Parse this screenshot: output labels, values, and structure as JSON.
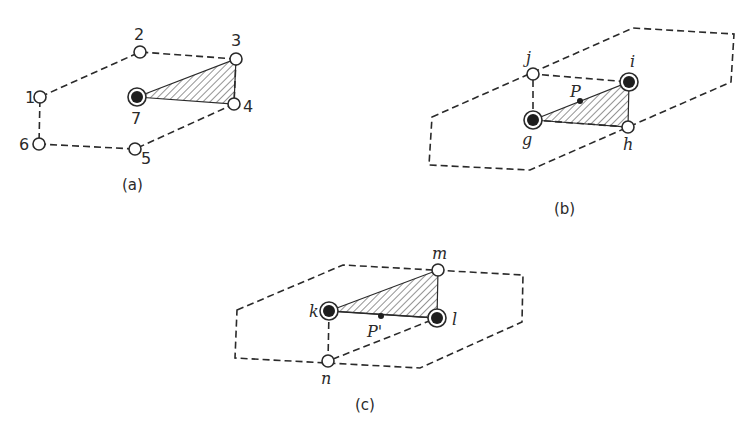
{
  "figure": {
    "panels": [
      {
        "id": "a",
        "caption": "(a)",
        "nodes": [
          {
            "label": "1",
            "type": "open"
          },
          {
            "label": "2",
            "type": "open"
          },
          {
            "label": "3",
            "type": "open"
          },
          {
            "label": "4",
            "type": "open"
          },
          {
            "label": "5",
            "type": "open"
          },
          {
            "label": "6",
            "type": "open"
          },
          {
            "label": "7",
            "type": "filled"
          }
        ],
        "hatched_triangle": [
          "7",
          "3",
          "4"
        ]
      },
      {
        "id": "b",
        "caption": "(b)",
        "nodes": [
          {
            "label": "j",
            "type": "open"
          },
          {
            "label": "i",
            "type": "filled"
          },
          {
            "label": "h",
            "type": "open"
          },
          {
            "label": "g",
            "type": "filled"
          }
        ],
        "point": "P",
        "hatched_triangle": [
          "g",
          "i",
          "h"
        ]
      },
      {
        "id": "c",
        "caption": "(c)",
        "nodes": [
          {
            "label": "m",
            "type": "open"
          },
          {
            "label": "k",
            "type": "filled"
          },
          {
            "label": "l",
            "type": "filled"
          },
          {
            "label": "n",
            "type": "open"
          }
        ],
        "point": "P'",
        "hatched_triangle": [
          "k",
          "m",
          "l"
        ]
      }
    ]
  }
}
